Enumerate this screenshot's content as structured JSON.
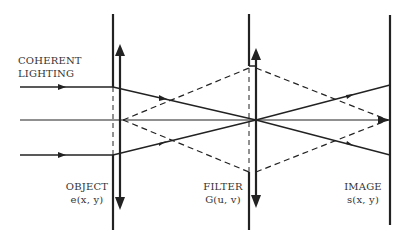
{
  "diagram": {
    "source_label_line1": "COHERENT",
    "source_label_line2": "LIGHTING",
    "planes": [
      {
        "id": "object",
        "name": "OBJECT",
        "function": "e(x, y)"
      },
      {
        "id": "filter",
        "name": "FILTER",
        "function": "G(u, v)"
      },
      {
        "id": "image",
        "name": "IMAGE",
        "function": "s(x, y)"
      }
    ],
    "colors": {
      "ink": "#222222",
      "background": "#ffffff"
    }
  }
}
